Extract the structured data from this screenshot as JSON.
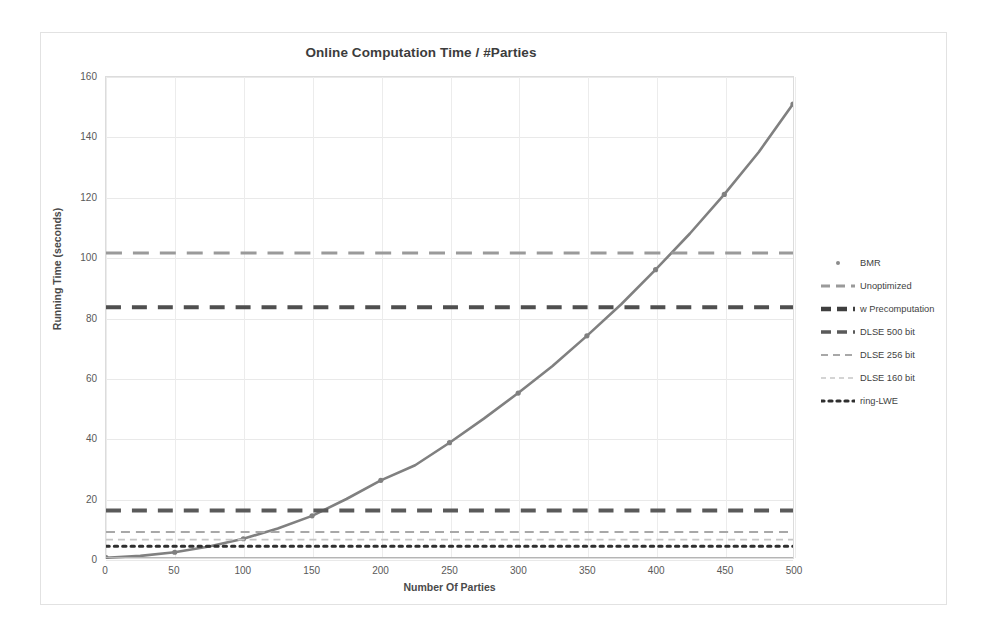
{
  "chart_data": {
    "type": "line",
    "title": "Online Computation Time / #Parties",
    "xlabel": "Number Of Parties",
    "ylabel": "Running Time (seconds)",
    "xlim": [
      0,
      500
    ],
    "ylim": [
      0,
      160
    ],
    "xticks": [
      0,
      50,
      100,
      150,
      200,
      250,
      300,
      350,
      400,
      450,
      500
    ],
    "yticks": [
      0,
      20,
      40,
      60,
      80,
      100,
      120,
      140,
      160
    ],
    "grid": true,
    "legend_position": "right",
    "series": [
      {
        "name": "BMR",
        "style": "line-with-markers",
        "color": "#808080",
        "x": [
          0,
          25,
          50,
          75,
          100,
          125,
          150,
          175,
          200,
          225,
          250,
          275,
          300,
          325,
          350,
          375,
          400,
          425,
          450,
          475,
          500
        ],
        "values": [
          0.3,
          0.9,
          2.1,
          4.0,
          6.6,
          10.0,
          14.2,
          19.8,
          26.0,
          31.0,
          38.5,
          46.5,
          55.0,
          64.0,
          74.0,
          84.5,
          96.0,
          108.0,
          121.0,
          135.0,
          151.0
        ]
      },
      {
        "name": "Unoptimized",
        "style": "dashed-horizontal",
        "color": "#9a9a9a",
        "constant_value": 101.5
      },
      {
        "name": "w Precomputation",
        "style": "dashed-horizontal-bold",
        "color": "#4f4f4f",
        "constant_value": 83.5
      },
      {
        "name": "DLSE 500 bit",
        "style": "dashed-horizontal-bold",
        "color": "#5a5a5a",
        "constant_value": 16.0
      },
      {
        "name": "DLSE 256 bit",
        "style": "dashed-horizontal-thin",
        "color": "#a8a8a8",
        "constant_value": 8.8
      },
      {
        "name": "DLSE 160 bit",
        "style": "dashed-horizontal-faint",
        "color": "#c6c6c6",
        "constant_value": 6.3
      },
      {
        "name": "ring-LWE",
        "style": "dotted-horizontal",
        "color": "#2f2f2f",
        "constant_value": 4.1
      }
    ]
  },
  "legend": {
    "items": [
      {
        "label": "BMR",
        "swatch": "marker-only"
      },
      {
        "label": "Unoptimized",
        "swatch": "dash-thin"
      },
      {
        "label": "w Precomputation",
        "swatch": "dash-bold-dark"
      },
      {
        "label": "DLSE 500 bit",
        "swatch": "dash-bold"
      },
      {
        "label": "DLSE 256 bit",
        "swatch": "dash-light"
      },
      {
        "label": "DLSE 160 bit",
        "swatch": "dash-faint"
      },
      {
        "label": "ring-LWE",
        "swatch": "dotted"
      }
    ]
  }
}
